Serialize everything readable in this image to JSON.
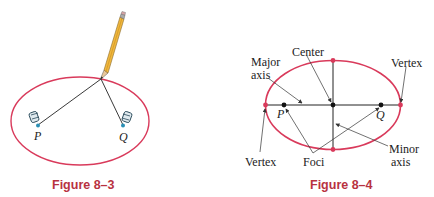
{
  "figure_3": {
    "caption": "Figure 8–3",
    "focus_p_label": "P",
    "focus_q_label": "Q",
    "ellipse_color": "#d93a5b",
    "pin_color": "#2a8fb5"
  },
  "figure_4": {
    "caption": "Figure 8–4",
    "labels": {
      "center": "Center",
      "major_line1": "Major",
      "major_line2": "axis",
      "vertex_right": "Vertex",
      "vertex_left": "Vertex",
      "foci": "Foci",
      "minor_line1": "Minor",
      "minor_line2": "axis",
      "p": "P",
      "q": "Q"
    },
    "ellipse_color": "#d93a5b"
  },
  "caption_color": "#b8323f"
}
